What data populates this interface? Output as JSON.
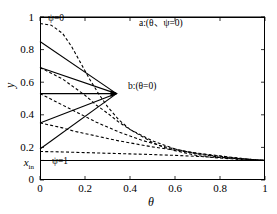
{
  "chart_data": {
    "type": "line",
    "title": "",
    "xlabel": "θ",
    "ylabel": "y",
    "xlim": [
      0,
      1
    ],
    "ylim": [
      0,
      1
    ],
    "grid": false,
    "legend": "none",
    "x_ticks": [
      "0",
      "0.2",
      "0.4",
      "0.6",
      "0.8",
      "1"
    ],
    "x_tick_values": [
      0,
      0.2,
      0.4,
      0.6,
      0.8,
      1
    ],
    "y_ticks": [
      "0",
      "x_in",
      "0.2",
      "0.4",
      "0.6",
      "0.8",
      "1"
    ],
    "y_tick_values": [
      0,
      0.12,
      0.2,
      0.4,
      0.6,
      0.8,
      1
    ],
    "x_in_value": 0.12,
    "convergence_point": {
      "label": "b",
      "x": 0.34,
      "y": 0.53
    },
    "annotations": [
      {
        "name": "psi-zero-label",
        "text": "ψ=0",
        "x": 0.04,
        "y": 1.0
      },
      {
        "name": "psi-one-label",
        "text": "ψ=1",
        "x": 0.06,
        "y": 0.12
      },
      {
        "name": "point-a-label",
        "text": "a:(θ、ψ=0)",
        "x": 0.42,
        "y": 0.97
      },
      {
        "name": "point-b-label",
        "text": "b:(θ=0)",
        "x": 0.38,
        "y": 0.53
      }
    ],
    "series": [
      {
        "name": "psi-0-boundary",
        "style": "solid",
        "points": [
          [
            0,
            1
          ],
          [
            1,
            1
          ]
        ]
      },
      {
        "name": "psi-1-boundary",
        "style": "solid",
        "points": [
          [
            0,
            0.12
          ],
          [
            1,
            0.12
          ]
        ]
      },
      {
        "name": "ray-1",
        "style": "solid",
        "points": [
          [
            0,
            0.85
          ],
          [
            0.34,
            0.53
          ]
        ]
      },
      {
        "name": "ray-2",
        "style": "solid",
        "points": [
          [
            0,
            0.69
          ],
          [
            0.34,
            0.53
          ]
        ]
      },
      {
        "name": "ray-3",
        "style": "solid",
        "points": [
          [
            0,
            0.53
          ],
          [
            0.34,
            0.53
          ]
        ]
      },
      {
        "name": "ray-4",
        "style": "solid",
        "points": [
          [
            0,
            0.35
          ],
          [
            0.34,
            0.53
          ]
        ]
      },
      {
        "name": "ray-5",
        "style": "solid",
        "points": [
          [
            0,
            0.19
          ],
          [
            0.34,
            0.53
          ]
        ]
      },
      {
        "name": "decay-1",
        "style": "dashed",
        "points": [
          [
            0,
            0.96
          ],
          [
            0.05,
            0.95
          ],
          [
            0.1,
            0.9
          ],
          [
            0.14,
            0.82
          ],
          [
            0.18,
            0.72
          ],
          [
            0.22,
            0.62
          ],
          [
            0.26,
            0.53
          ],
          [
            0.3,
            0.45
          ],
          [
            0.35,
            0.37
          ],
          [
            0.4,
            0.31
          ],
          [
            0.45,
            0.27
          ],
          [
            0.5,
            0.23
          ],
          [
            0.55,
            0.2
          ],
          [
            0.6,
            0.18
          ],
          [
            0.65,
            0.165
          ],
          [
            0.7,
            0.15
          ],
          [
            0.75,
            0.14
          ],
          [
            0.8,
            0.135
          ],
          [
            0.85,
            0.13
          ],
          [
            0.9,
            0.125
          ],
          [
            0.95,
            0.122
          ],
          [
            1,
            0.12
          ]
        ]
      },
      {
        "name": "decay-2",
        "style": "dashed",
        "points": [
          [
            0,
            0.69
          ],
          [
            0.05,
            0.655
          ],
          [
            0.1,
            0.62
          ],
          [
            0.15,
            0.57
          ],
          [
            0.2,
            0.52
          ],
          [
            0.25,
            0.46
          ],
          [
            0.3,
            0.41
          ],
          [
            0.35,
            0.355
          ],
          [
            0.4,
            0.31
          ],
          [
            0.45,
            0.275
          ],
          [
            0.5,
            0.24
          ],
          [
            0.55,
            0.215
          ],
          [
            0.6,
            0.19
          ],
          [
            0.65,
            0.175
          ],
          [
            0.7,
            0.16
          ],
          [
            0.75,
            0.15
          ],
          [
            0.8,
            0.14
          ],
          [
            0.85,
            0.133
          ],
          [
            0.9,
            0.128
          ],
          [
            0.95,
            0.123
          ],
          [
            1,
            0.12
          ]
        ]
      },
      {
        "name": "decay-3",
        "style": "dashed",
        "points": [
          [
            0,
            0.53
          ],
          [
            0.05,
            0.495
          ],
          [
            0.1,
            0.46
          ],
          [
            0.15,
            0.425
          ],
          [
            0.2,
            0.39
          ],
          [
            0.25,
            0.355
          ],
          [
            0.3,
            0.325
          ],
          [
            0.35,
            0.295
          ],
          [
            0.4,
            0.27
          ],
          [
            0.45,
            0.245
          ],
          [
            0.5,
            0.225
          ],
          [
            0.55,
            0.205
          ],
          [
            0.6,
            0.19
          ],
          [
            0.65,
            0.175
          ],
          [
            0.7,
            0.163
          ],
          [
            0.75,
            0.153
          ],
          [
            0.8,
            0.145
          ],
          [
            0.85,
            0.137
          ],
          [
            0.9,
            0.13
          ],
          [
            0.95,
            0.124
          ],
          [
            1,
            0.12
          ]
        ]
      },
      {
        "name": "decay-4",
        "style": "dashed",
        "points": [
          [
            0,
            0.35
          ],
          [
            0.05,
            0.335
          ],
          [
            0.1,
            0.32
          ],
          [
            0.15,
            0.3
          ],
          [
            0.2,
            0.285
          ],
          [
            0.25,
            0.27
          ],
          [
            0.3,
            0.255
          ],
          [
            0.35,
            0.24
          ],
          [
            0.4,
            0.228
          ],
          [
            0.45,
            0.215
          ],
          [
            0.5,
            0.203
          ],
          [
            0.55,
            0.193
          ],
          [
            0.6,
            0.183
          ],
          [
            0.65,
            0.173
          ],
          [
            0.7,
            0.165
          ],
          [
            0.75,
            0.156
          ],
          [
            0.8,
            0.148
          ],
          [
            0.85,
            0.14
          ],
          [
            0.9,
            0.132
          ],
          [
            0.95,
            0.125
          ],
          [
            1,
            0.12
          ]
        ]
      },
      {
        "name": "decay-5",
        "style": "dashed",
        "points": [
          [
            0,
            0.175
          ],
          [
            0.1,
            0.172
          ],
          [
            0.2,
            0.168
          ],
          [
            0.3,
            0.164
          ],
          [
            0.4,
            0.16
          ],
          [
            0.5,
            0.156
          ],
          [
            0.6,
            0.151
          ],
          [
            0.7,
            0.145
          ],
          [
            0.8,
            0.138
          ],
          [
            0.9,
            0.13
          ],
          [
            1,
            0.12
          ]
        ]
      }
    ]
  },
  "axes": {
    "xlabel": "θ",
    "ylabel": "y",
    "x_tick_labels": [
      "0",
      "0.2",
      "0.4",
      "0.6",
      "0.8",
      "1"
    ],
    "y_tick_labels": [
      "1",
      "0.8",
      "0.6",
      "0.4",
      "0.2",
      "0"
    ],
    "y_special_tick": {
      "base": "x",
      "sub": "in"
    }
  },
  "labels": {
    "psi_zero": "ψ=0",
    "psi_one": "ψ=1",
    "point_a": "a:(θ、ψ=0)",
    "point_b": "b:(θ=0)"
  },
  "colors": {
    "line": "#000000",
    "background": "#ffffff"
  }
}
